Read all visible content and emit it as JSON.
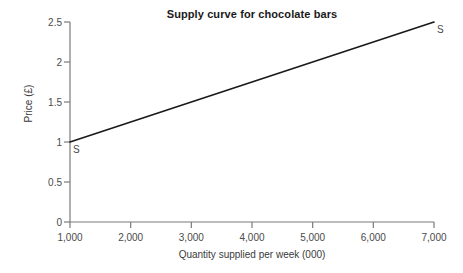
{
  "chart_data": {
    "type": "line",
    "title": "Supply curve for chocolate bars",
    "xlabel": "Quantity supplied per week (000)",
    "ylabel": "Price (£)",
    "xlim": [
      1000,
      7000
    ],
    "ylim": [
      0,
      2.5
    ],
    "grid": false,
    "legend": "none",
    "x_ticks": [
      {
        "value": 1000,
        "label": "1,000"
      },
      {
        "value": 2000,
        "label": "2,000"
      },
      {
        "value": 3000,
        "label": "3,000"
      },
      {
        "value": 4000,
        "label": "4,000"
      },
      {
        "value": 5000,
        "label": "5,000"
      },
      {
        "value": 6000,
        "label": "6,000"
      },
      {
        "value": 7000,
        "label": "7,000"
      }
    ],
    "y_ticks": [
      {
        "value": 0,
        "label": "0"
      },
      {
        "value": 0.5,
        "label": "0.5"
      },
      {
        "value": 1,
        "label": "1"
      },
      {
        "value": 1.5,
        "label": "1.5"
      },
      {
        "value": 2,
        "label": "2"
      },
      {
        "value": 2.5,
        "label": "2.5"
      }
    ],
    "series": [
      {
        "name": "S",
        "color": "#1a1a1a",
        "x": [
          1000,
          7000
        ],
        "values": [
          1.0,
          2.5
        ],
        "annotations": [
          {
            "label": "S",
            "x": 1000,
            "y": 1.0,
            "position": "below-right"
          },
          {
            "label": "S",
            "x": 7000,
            "y": 2.5,
            "position": "below-right"
          }
        ]
      }
    ]
  },
  "style": {
    "axis_color": "#7a7a7a",
    "line_color": "#1a1a1a",
    "text_color": "#3a3a3a",
    "background": "#ffffff"
  }
}
